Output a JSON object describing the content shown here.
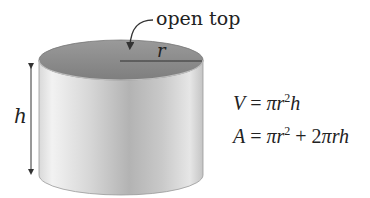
{
  "diagram": {
    "labels": {
      "open_top": "open top",
      "radius": "r",
      "height": "h"
    },
    "formulas": {
      "volume": {
        "lhs": "V",
        "eq": " = ",
        "pi": "π",
        "r": "r",
        "exp": "2",
        "h": "h"
      },
      "area": {
        "lhs": "A",
        "eq": " = ",
        "pi1": "π",
        "r1": "r",
        "exp1": "2",
        "plus": " + 2",
        "pi2": "π",
        "rh": "rh"
      }
    },
    "colors": {
      "top_inner": "#8a8a8a",
      "side_light": "#eeeeee",
      "side_mid": "#cfcfcf",
      "side_dark": "#a9a9a9",
      "line": "#333333"
    }
  }
}
